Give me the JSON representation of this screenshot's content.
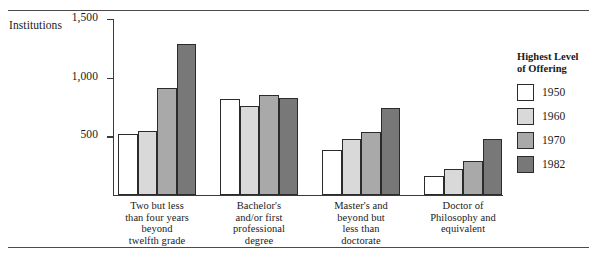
{
  "axis_title": "Institutions",
  "legend": {
    "title_line1": "Highest Level",
    "title_line2": "of Offering",
    "entries": [
      {
        "label": "1950",
        "color": "#ffffff"
      },
      {
        "label": "1960",
        "color": "#d9d9d9"
      },
      {
        "label": "1970",
        "color": "#a9a9a9"
      },
      {
        "label": "1982",
        "color": "#787878"
      }
    ]
  },
  "ticks": [
    {
      "label": "1,500",
      "value": 1500
    },
    {
      "label": "1,000",
      "value": 1000
    },
    {
      "label": "500",
      "value": 500
    }
  ],
  "categories_text": [
    {
      "lines": [
        "Two but less",
        "than four years",
        "beyond",
        "twelfth grade"
      ]
    },
    {
      "lines": [
        "Bachelor's",
        "and/or first",
        "professional",
        "degree"
      ]
    },
    {
      "lines": [
        "Master's and",
        "beyond but",
        "less than",
        "doctorate"
      ]
    },
    {
      "lines": [
        "Doctor of",
        "Philosophy and",
        "equivalent"
      ]
    }
  ],
  "chart_data": {
    "type": "bar",
    "title": "",
    "xlabel": "",
    "ylabel": "Institutions",
    "ylim": [
      0,
      1500
    ],
    "yticks": [
      500,
      1000,
      1500
    ],
    "ytick_labels": [
      "500",
      "1,000",
      "1,500"
    ],
    "grid": false,
    "legend_position": "right",
    "legend_title": "Highest Level of Offering",
    "categories": [
      "Two but less than four years beyond twelfth grade",
      "Bachelor's and/or first professional degree",
      "Master's and beyond but less than doctorate",
      "Doctor of Philosophy and equivalent"
    ],
    "series": [
      {
        "name": "1950",
        "color": "#ffffff",
        "values": [
          520,
          815,
          380,
          165
        ]
      },
      {
        "name": "1960",
        "color": "#d9d9d9",
        "values": [
          545,
          760,
          480,
          225
        ]
      },
      {
        "name": "1970",
        "color": "#a9a9a9",
        "values": [
          915,
          850,
          535,
          290
        ]
      },
      {
        "name": "1982",
        "color": "#787878",
        "values": [
          1285,
          830,
          745,
          475
        ]
      }
    ]
  },
  "layout": {
    "plot_width": 390,
    "plot_height": 176,
    "bar_width": 19.5,
    "group_gap": 24,
    "group_start": 5,
    "category_label_widths": [
      105,
      95,
      95,
      100
    ]
  }
}
